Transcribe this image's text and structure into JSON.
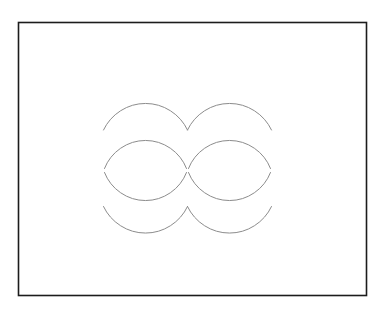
{
  "canvas": {
    "width": 383,
    "height": 312,
    "background": "#ffffff"
  },
  "frame": {
    "x": 18.5,
    "y": 22.5,
    "w": 348,
    "h": 273,
    "fill": "#ffffff",
    "stroke": "#1c1c1c",
    "stroke_width": 1.6
  },
  "figure": {
    "stroke": "#8c8c8c",
    "stroke_width": 1,
    "arcs": [
      {
        "name": "top-row-left-arc",
        "d": "M 103.5 130 A 46.5 46.5 0 0 1 187.5 130"
      },
      {
        "name": "top-row-right-arc",
        "d": "M 187.5 130 A 46.5 46.5 0 0 1 271.5 130"
      },
      {
        "name": "left-lens-upper-arc",
        "d": "M 104.5 168.5 A 44 44 0 0 1 186.5 168.5"
      },
      {
        "name": "left-lens-lower-arc",
        "d": "M 104.5 172.5 A 44 44 0 0 0 186.5 172.5"
      },
      {
        "name": "right-lens-upper-arc",
        "d": "M 188.5 168.5 A 44 44 0 0 1 270.5 168.5"
      },
      {
        "name": "right-lens-lower-arc",
        "d": "M 188.5 172.5 A 44 44 0 0 0 270.5 172.5"
      },
      {
        "name": "bottom-row-left-arc",
        "d": "M 103.5 206.5 A 46.5 46.5 0 0 0 187.5 206.5"
      },
      {
        "name": "bottom-row-right-arc",
        "d": "M 187.5 206.5 A 46.5 46.5 0 0 0 271.5 206.5"
      }
    ]
  }
}
